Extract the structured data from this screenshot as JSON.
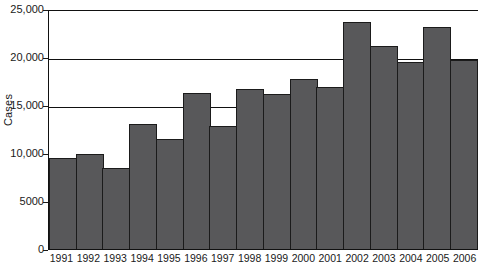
{
  "chart_data": {
    "type": "bar",
    "title": "",
    "xlabel": "",
    "ylabel": "Cases",
    "ylim": [
      0,
      25000
    ],
    "grid": true,
    "legend": null,
    "categories": [
      "1991",
      "1992",
      "1993",
      "1994",
      "1995",
      "1996",
      "1997",
      "1998",
      "1999",
      "2000",
      "2001",
      "2002",
      "2003",
      "2004",
      "2005",
      "2006"
    ],
    "values": [
      9500,
      9900,
      8400,
      13000,
      11500,
      16300,
      12800,
      16700,
      16100,
      17700,
      16900,
      23600,
      21100,
      19500,
      23100,
      19700
    ],
    "y_ticks": [
      {
        "value": 0,
        "label": "0"
      },
      {
        "value": 5000,
        "label": "5000"
      },
      {
        "value": 10000,
        "label": "10,000"
      },
      {
        "value": 15000,
        "label": "15,000"
      },
      {
        "value": 20000,
        "label": "20,000"
      },
      {
        "value": 25000,
        "label": "25,000"
      }
    ],
    "gridline_values": [
      15000,
      20000,
      25000
    ],
    "bar_color": "#58585a",
    "bar_border_color": "#1b1b1b",
    "axis_color": "#111111"
  }
}
